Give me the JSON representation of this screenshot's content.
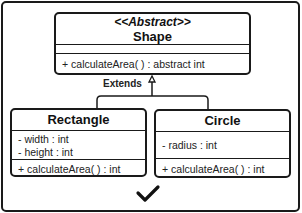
{
  "diagram": {
    "type": "UML class diagram",
    "relationship_label": "Extends",
    "abstract_class": {
      "stereotype": "<<Abstract>>",
      "name": "Shape",
      "attributes": [],
      "methods": [
        "+ calculateArea( ) : abstract int"
      ]
    },
    "subclasses": [
      {
        "name": "Rectangle",
        "attributes": [
          "- width : int",
          "- height : int"
        ],
        "methods": [
          "+ calculateArea( ) : int"
        ]
      },
      {
        "name": "Circle",
        "attributes": [
          "- radius : int"
        ],
        "methods": [
          "+ calculateArea( ) : int"
        ]
      }
    ],
    "status_icon": "checkmark-icon"
  }
}
